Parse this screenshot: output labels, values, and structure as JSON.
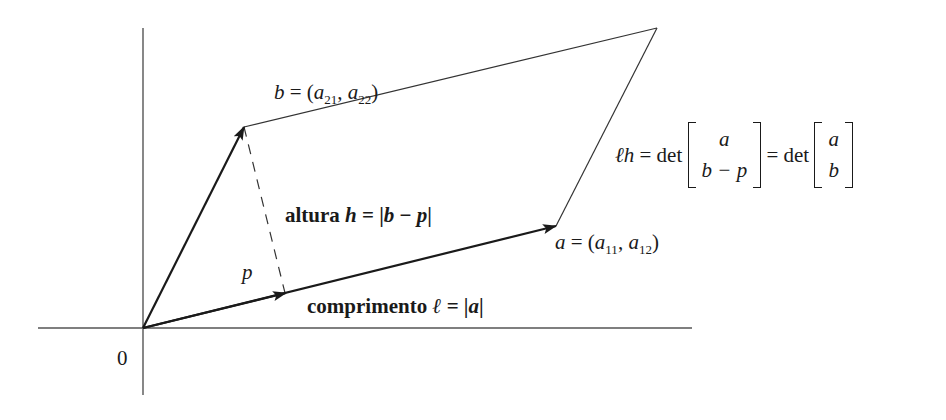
{
  "diagram": {
    "origin_label": "0",
    "vector_b_label": {
      "name": "b",
      "eq": " = (",
      "c1": "a",
      "c1_sub": "21",
      "sep": ", ",
      "c2": "a",
      "c2_sub": "22",
      "close": ")"
    },
    "vector_a_label": {
      "name": "a",
      "eq": " = (",
      "c1": "a",
      "c1_sub": "11",
      "sep": ", ",
      "c2": "a",
      "c2_sub": "12",
      "close": ")"
    },
    "projection_label": "p",
    "height_label": {
      "word": "altura ",
      "var": "h",
      "eq": " = |",
      "expr1": "b",
      "minus": " − ",
      "expr2": "p",
      "close": "|"
    },
    "length_label": {
      "word": "comprimento ",
      "var": "ℓ",
      "eq": " = |",
      "expr": "a",
      "close": "|"
    },
    "formula": {
      "lhs": "ℓh",
      "eq1": " = det ",
      "m1_row1": "a",
      "m1_row2": "b − p",
      "eq2": " = det ",
      "m2_row1": "a",
      "m2_row2": "b"
    },
    "colors": {
      "ink": "#1a1a1a",
      "axis": "#555555",
      "background": "#ffffff"
    }
  }
}
